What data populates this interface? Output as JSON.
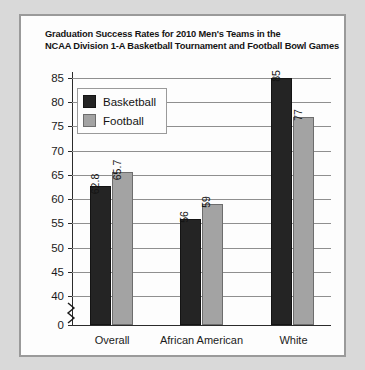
{
  "chart_data": {
    "type": "bar",
    "title": "Graduation Success Rates for 2010 Men's Teams in the NCAA Division 1-A Basketball Tournament and Football Bowl Games",
    "title_lines": [
      "Graduation Success Rates for 2010 Men's Teams in the",
      "NCAA Division 1-A Basketball Tournament and Football Bowl Games"
    ],
    "categories": [
      "Overall",
      "African American",
      "White"
    ],
    "series": [
      {
        "name": "Basketball",
        "color": "#242424",
        "values": [
          62.8,
          56,
          85
        ],
        "labels": [
          "62.8",
          "56",
          "85"
        ]
      },
      {
        "name": "Football",
        "color": "#a3a3a3",
        "values": [
          65.7,
          59,
          77
        ],
        "labels": [
          "65.7",
          "59",
          "77"
        ]
      }
    ],
    "xlabel": "",
    "ylabel": "",
    "ylim": [
      40,
      85
    ],
    "yticks": [
      85,
      80,
      75,
      70,
      65,
      60,
      55,
      50,
      45,
      40,
      0
    ],
    "ytick_labels": [
      "85",
      "80",
      "75",
      "70",
      "65",
      "60",
      "55",
      "50",
      "45",
      "40",
      "0"
    ],
    "y_axis_break": true,
    "y_axis_break_between": [
      0,
      40
    ],
    "grid": true,
    "grid_axis": "y",
    "legend_position": "upper-left",
    "legend_entries": [
      "Basketball",
      "Football"
    ],
    "background_color": "#fdfdfd",
    "frame_color": "#9a9a9a"
  }
}
